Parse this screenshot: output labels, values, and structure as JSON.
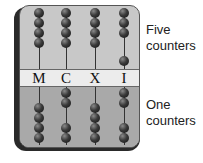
{
  "diagram": {
    "columns": [
      {
        "letter": "M",
        "x": 38,
        "upper_beads_y": [
          12,
          22,
          32,
          42
        ],
        "lower_beads_y": [
          107,
          117,
          127,
          137
        ]
      },
      {
        "letter": "C",
        "x": 65,
        "upper_beads_y": [
          12,
          22,
          32,
          42
        ],
        "lower_beads_y": [
          92,
          102,
          127,
          137
        ]
      },
      {
        "letter": "X",
        "x": 94,
        "upper_beads_y": [
          12,
          22,
          32,
          42
        ],
        "lower_beads_y": [
          107,
          117,
          127,
          137
        ]
      },
      {
        "letter": "I",
        "x": 123,
        "upper_beads_y": [
          12,
          22,
          32,
          60
        ],
        "lower_beads_y": [
          92,
          102,
          127,
          137
        ]
      }
    ],
    "labels": {
      "upper": [
        "Five",
        "counters"
      ],
      "lower": [
        "One",
        "counters"
      ]
    },
    "colors": {
      "board_upper": "#c8c8c8",
      "board_lower": "#a9a9a9",
      "band": "#ececec",
      "bead": "#2a2a2a"
    }
  }
}
